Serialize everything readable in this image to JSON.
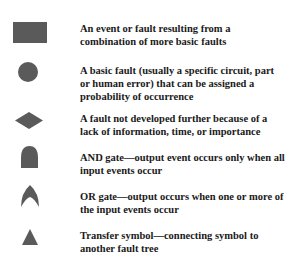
{
  "legend": {
    "items": [
      {
        "symbol": "rectangle",
        "label": "An event or fault resulting from a combination of more basic faults"
      },
      {
        "symbol": "circle",
        "label": "A basic fault (usually a specific circuit, part or human error) that can be assigned a probability of occurrence"
      },
      {
        "symbol": "diamond",
        "label": "A fault not developed further because of a lack of information, time, or importance"
      },
      {
        "symbol": "and-gate",
        "label": "AND gate—output event occurs only when all input events occur"
      },
      {
        "symbol": "or-gate",
        "label": "OR gate—output occurs when one or more of the input events occur"
      },
      {
        "symbol": "triangle",
        "label": "Transfer symbol—connecting symbol to another fault tree"
      }
    ],
    "colors": {
      "symbol_fill": "#5a5a5a",
      "text": "#1a1a1a"
    }
  }
}
